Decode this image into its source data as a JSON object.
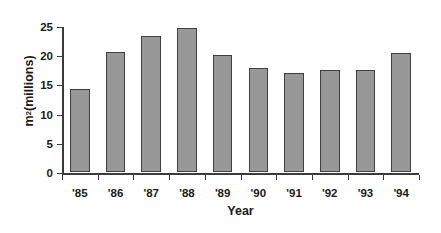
{
  "chart_data": {
    "type": "bar",
    "title": "",
    "subtitle": "",
    "xlabel": "Year",
    "ylabel": "m² (millions)",
    "ylabel_base": "m",
    "ylabel_sup": "2",
    "ylabel_rest": " (millions)",
    "categories": [
      "'85",
      "'86",
      "'87",
      "'88",
      "'89",
      "'90",
      "'91",
      "'92",
      "'93",
      "'94"
    ],
    "values": [
      14.3,
      20.6,
      23.3,
      24.6,
      20.0,
      17.8,
      16.9,
      17.5,
      17.5,
      20.4
    ],
    "series": [
      {
        "name": "Floor area",
        "values": [
          14.3,
          20.6,
          23.3,
          24.6,
          20.0,
          17.8,
          16.9,
          17.5,
          17.5,
          20.4
        ]
      }
    ],
    "ylim": [
      0,
      25
    ],
    "yticks": [
      0,
      5,
      10,
      15,
      20,
      25
    ],
    "ytick_labels": [
      "0",
      "5",
      "10",
      "15",
      "20",
      "25"
    ],
    "grid": false,
    "legend": false,
    "legend_position": "none",
    "bar_fill_color": "#989898",
    "bar_border_color": "#3f3f3f",
    "axis_color": "#3b3b3b",
    "background_color": "#ffffff",
    "text_color": "#1a1a1a",
    "annotations": []
  }
}
